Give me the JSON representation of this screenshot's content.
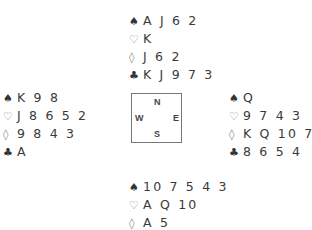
{
  "suit_icons": {
    "spades": "♠",
    "hearts": "♡",
    "diamonds": "◊",
    "clubs": "♣"
  },
  "compass": {
    "n": "N",
    "s": "S",
    "w": "W",
    "e": "E"
  },
  "hands": {
    "north": {
      "spades": "A J 6 2",
      "hearts": "K",
      "diamonds": "J 6 2",
      "clubs": "K J 9 7 3"
    },
    "west": {
      "spades": "K 9 8",
      "hearts": "J 8 6 5 2",
      "diamonds": "9 8 4 3",
      "clubs": "A"
    },
    "east": {
      "spades": "Q",
      "hearts": "9 7 4 3",
      "diamonds": "K Q 10 7",
      "clubs": "8 6 5 4"
    },
    "south": {
      "spades": "10 7 5 4 3",
      "hearts": "A Q 10",
      "diamonds": "A 5",
      "clubs": "Q 10 2"
    }
  }
}
